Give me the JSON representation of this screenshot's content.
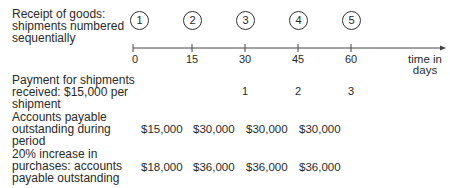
{
  "labels": {
    "receipt": "Receipt of goods: shipments numbered sequentially",
    "receipt_lines": [
      "Receipt of goods:",
      "shipments numbered",
      "sequentially"
    ],
    "payment_lines": [
      "Payment for shipments",
      "received: $15,000 per",
      "shipment"
    ],
    "ap_lines": [
      "Accounts payable",
      "outstanding during",
      "period"
    ],
    "increase_lines": [
      "20% increase in",
      "purchases: accounts",
      "payable outstanding"
    ],
    "axis_title_lines": [
      "time in",
      "days"
    ]
  },
  "shipments": [
    "1",
    "2",
    "3",
    "4",
    "5"
  ],
  "axis_ticks": [
    "0",
    "15",
    "30",
    "45",
    "60"
  ],
  "payments": [
    "1",
    "2",
    "3"
  ],
  "accounts_payable": [
    "$15,000",
    "$30,000",
    "$30,000",
    "$30,000"
  ],
  "increased_payable": [
    "$18,000",
    "$36,000",
    "$36,000",
    "$36,000"
  ]
}
